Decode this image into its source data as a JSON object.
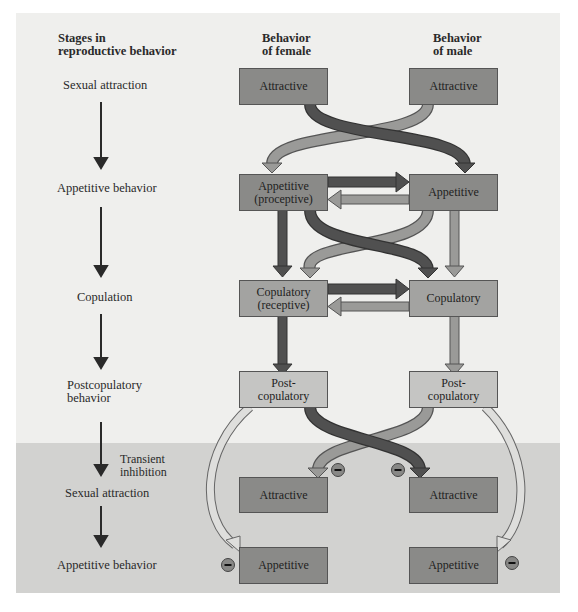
{
  "headers": {
    "stages": "Stages in reproductive behavior",
    "stages_line1": "Stages in",
    "stages_line2": "reproductive behavior",
    "female_line1": "Behavior",
    "female_line2": "of female",
    "male_line1": "Behavior",
    "male_line2": "of male"
  },
  "stages": [
    {
      "label": "Sexual attraction"
    },
    {
      "label": "Appetitive behavior"
    },
    {
      "label": "Copulation"
    },
    {
      "label_line1": "Postcopulatory",
      "label_line2": "behavior"
    },
    {
      "label": "Sexual attraction"
    },
    {
      "label": "Appetitive behavior"
    }
  ],
  "transient_inhibition": {
    "line1": "Transient",
    "line2": "inhibition"
  },
  "female_boxes": [
    {
      "line1": "Attractive",
      "line2": ""
    },
    {
      "line1": "Appetitive",
      "line2": "(proceptive)"
    },
    {
      "line1": "Copulatory",
      "line2": "(receptive)"
    },
    {
      "line1": "Post-",
      "line2": "copulatory"
    },
    {
      "line1": "Attractive",
      "line2": ""
    },
    {
      "line1": "Appetitive",
      "line2": ""
    }
  ],
  "male_boxes": [
    {
      "line1": "Attractive",
      "line2": ""
    },
    {
      "line1": "Appetitive",
      "line2": ""
    },
    {
      "line1": "Copulatory",
      "line2": ""
    },
    {
      "line1": "Post-",
      "line2": "copulatory"
    },
    {
      "line1": "Attractive",
      "line2": ""
    },
    {
      "line1": "Appetitive",
      "line2": ""
    }
  ],
  "inhibition_symbol": "−",
  "colors": {
    "panel_top": "#efefed",
    "panel_bottom": "#d2d2d0",
    "female_arrow": "#505050",
    "male_arrow": "#9a9a98",
    "box_dark": "#8a8a88",
    "box_mid": "#a3a3a1",
    "box_light": "#c5c5c3",
    "hollow_arrow": "#d8d8d6"
  }
}
